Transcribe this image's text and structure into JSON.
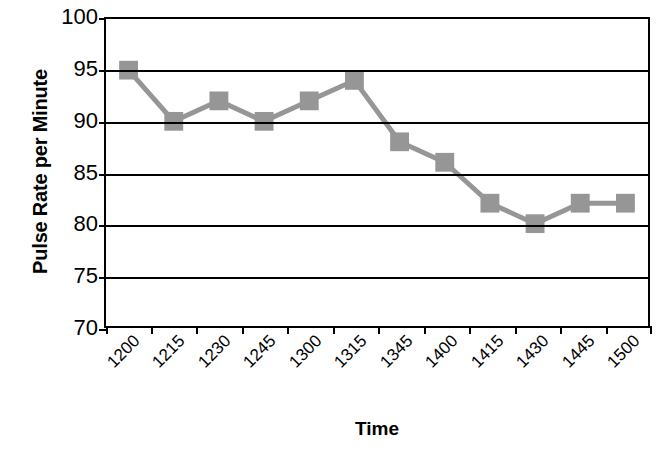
{
  "chart_data": {
    "type": "line",
    "title": "",
    "xlabel": "Time",
    "ylabel": "Pulse Rate per Minute",
    "categories": [
      "1200",
      "1215",
      "1230",
      "1245",
      "1300",
      "1315",
      "1345",
      "1400",
      "1415",
      "1430",
      "1445",
      "1500"
    ],
    "values": [
      95,
      90,
      92,
      90,
      92,
      94,
      88,
      86,
      82,
      80,
      82,
      82
    ],
    "series": [
      {
        "name": "Pulse Rate",
        "values": [
          95,
          90,
          92,
          90,
          92,
          94,
          88,
          86,
          82,
          80,
          82,
          82
        ]
      }
    ],
    "ylim": [
      70,
      100
    ],
    "yticks": [
      70,
      75,
      80,
      85,
      90,
      95,
      100
    ],
    "ytick_labels": [
      "70",
      "75",
      "80",
      "85",
      "90",
      "95",
      "100"
    ],
    "grid": true,
    "grid_axis": "y",
    "legend": false,
    "legend_position": "none",
    "marker": "square",
    "colors": {
      "series": "#969696",
      "grid": "#000000",
      "axis": "#000000",
      "background": "#ffffff",
      "text": "#000000"
    }
  }
}
